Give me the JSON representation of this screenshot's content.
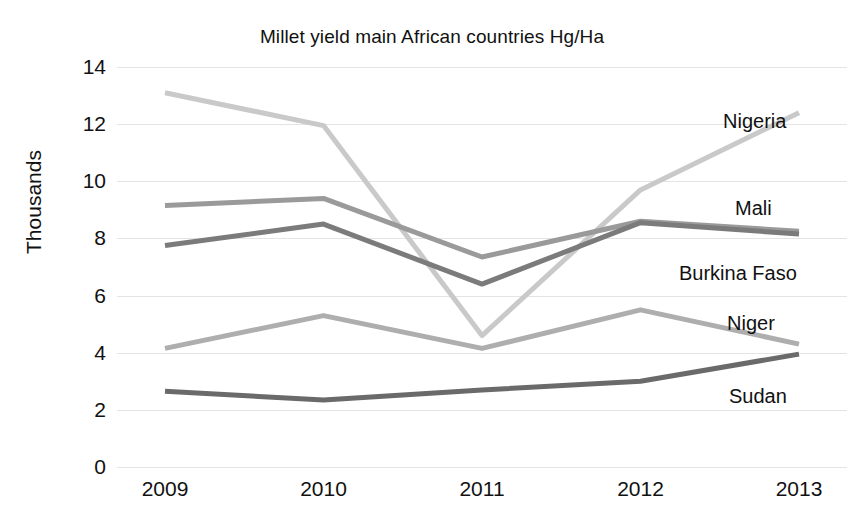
{
  "chart_data": {
    "type": "line",
    "title": "Millet yield main African countries Hg/Ha",
    "xlabel": "",
    "ylabel": "Thousands",
    "categories": [
      "2009",
      "2010",
      "2011",
      "2012",
      "2013"
    ],
    "x": [
      2009,
      2010,
      2011,
      2012,
      2013
    ],
    "ylim": [
      0,
      14
    ],
    "yticks": [
      "0",
      "2",
      "4",
      "6",
      "8",
      "10",
      "12",
      "14"
    ],
    "ytick_values": [
      0,
      2,
      4,
      6,
      8,
      10,
      12,
      14
    ],
    "grid": true,
    "legend_position": "right-inline-labels",
    "series": [
      {
        "name": "Nigeria",
        "values": [
          13.1,
          11.95,
          4.6,
          9.7,
          12.4
        ],
        "color": "#c9c9c9",
        "label_y": 12.1
      },
      {
        "name": "Mali",
        "values": [
          9.15,
          9.4,
          7.35,
          8.6,
          8.25
        ],
        "color": "#9a9a9a",
        "label_y": 9.05
      },
      {
        "name": "Burkina Faso",
        "values": [
          7.75,
          8.5,
          6.4,
          8.55,
          8.15
        ],
        "color": "#7b7b7b",
        "label_y": 6.8
      },
      {
        "name": "Niger",
        "values": [
          4.15,
          5.3,
          4.15,
          5.5,
          4.3
        ],
        "color": "#aeaeae",
        "label_y": 5.05
      },
      {
        "name": "Sudan",
        "values": [
          2.65,
          2.35,
          2.7,
          3.0,
          3.95
        ],
        "color": "#6a6a6a",
        "label_y": 2.5
      }
    ]
  },
  "colors": {
    "background": "#ffffff",
    "text": "#111111",
    "gridline": "#e4e4e4"
  }
}
